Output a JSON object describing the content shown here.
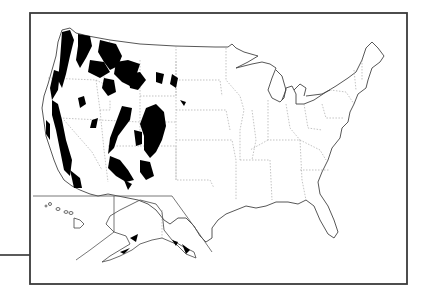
{
  "map": {
    "subject": "United States map with shaded regions concentrated in the western states",
    "regions_shown": [
      "Contiguous United States",
      "Alaska inset",
      "Hawaii inset"
    ],
    "frame": {
      "x": 29,
      "y": 13,
      "width": 378,
      "height": 271
    },
    "leader_line": {
      "x1": 0,
      "y1": 255,
      "x2": 29,
      "y2": 255
    },
    "colors": {
      "background": "#ffffff",
      "frame": "#3a3a3a",
      "outline": "#444444",
      "state_border": "#9a9a9a",
      "shaded_region": "#000000"
    }
  }
}
